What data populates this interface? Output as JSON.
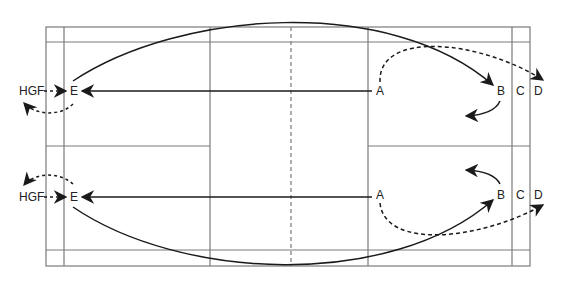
{
  "diagram": {
    "type": "badminton-court-movement-diagram",
    "colors": {
      "court_lines": "#7a7a7a",
      "arrows": "#1a1a1a",
      "background": "#ffffff"
    },
    "labels": {
      "top": {
        "hgf": "HGF",
        "e": "E",
        "a": "A",
        "b": "B",
        "c": "C",
        "d": "D"
      },
      "bottom": {
        "hgf": "HGF",
        "e": "E",
        "a": "A",
        "b": "B",
        "c": "C",
        "d": "D"
      }
    },
    "arrows": [
      {
        "from": "A",
        "to": "E",
        "style": "solid",
        "half": "top"
      },
      {
        "from": "E",
        "to": "B",
        "style": "solid-curve",
        "half": "top"
      },
      {
        "from": "A",
        "to": "D",
        "style": "dashed-curve",
        "half": "top"
      },
      {
        "from": "HGF",
        "to": "E",
        "style": "dashed",
        "half": "top"
      },
      {
        "from": "E",
        "to": "HGF",
        "style": "dashed-curve",
        "half": "top"
      },
      {
        "from": "B",
        "to": "back",
        "style": "solid-curve",
        "half": "top"
      },
      {
        "from": "A",
        "to": "E",
        "style": "solid",
        "half": "bottom"
      },
      {
        "from": "E",
        "to": "B",
        "style": "solid-curve",
        "half": "bottom"
      },
      {
        "from": "A",
        "to": "D",
        "style": "dashed-curve",
        "half": "bottom"
      },
      {
        "from": "HGF",
        "to": "E",
        "style": "dashed",
        "half": "bottom"
      },
      {
        "from": "E",
        "to": "HGF",
        "style": "dashed-curve",
        "half": "bottom"
      },
      {
        "from": "B",
        "to": "back",
        "style": "solid-curve",
        "half": "bottom"
      }
    ]
  }
}
